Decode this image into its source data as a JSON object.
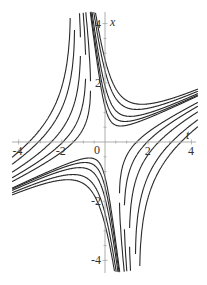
{
  "chart_data": {
    "type": "line",
    "title": "",
    "xlabel": "t",
    "ylabel": "x",
    "xlim": [
      -4.3,
      4.3
    ],
    "ylim": [
      -4.4,
      4.4
    ],
    "grid": false,
    "legend": null,
    "x_ticks": [
      -4,
      -2,
      0,
      2,
      4
    ],
    "x_tick_labels": [
      "-4",
      "-2",
      "0",
      "2",
      "4"
    ],
    "y_ticks": [
      -4,
      -2,
      2,
      4
    ],
    "y_tick_labels": [
      "-4",
      "-2",
      "2",
      "4"
    ],
    "asymptote_slopes": [
      -6,
      0.35
    ],
    "series": [
      {
        "name": "upper family",
        "k": [
          7.8,
          5.8,
          3.6,
          2.3,
          1.4
        ]
      },
      {
        "name": "lower family",
        "k": [
          7.8,
          5.8,
          3.6,
          2.3,
          1.4
        ],
        "mirror": true
      },
      {
        "name": "left family",
        "k": [
          -4.5,
          -8,
          -13,
          -20,
          -26
        ]
      },
      {
        "name": "right family",
        "k": [
          -4.5,
          -8,
          -13,
          -20,
          -26
        ],
        "mirror": true
      }
    ],
    "x_at_t0_upper": [
      2.8,
      2.4,
      1.9,
      1.5,
      1.2
    ]
  },
  "axes": {
    "t_label": "t",
    "x_label": "x",
    "zero_label": "0"
  }
}
